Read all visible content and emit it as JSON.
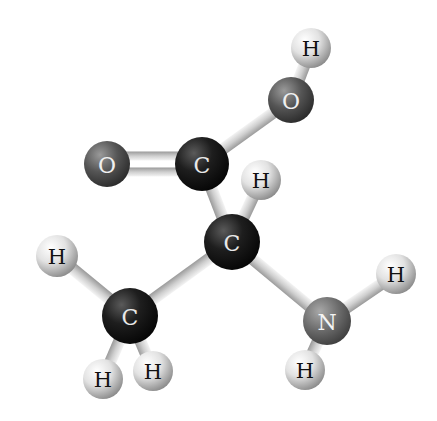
{
  "diagram": {
    "type": "ball-and-stick molecular model",
    "molecule_atoms": [
      {
        "id": "h_oh",
        "element": "H",
        "label": "H",
        "x": 311,
        "y": 48,
        "r": 20
      },
      {
        "id": "o_hydroxyl",
        "element": "O",
        "label": "O",
        "x": 291,
        "y": 100,
        "r": 23
      },
      {
        "id": "o_carbonyl",
        "element": "O",
        "label": "O",
        "x": 107,
        "y": 164,
        "r": 23
      },
      {
        "id": "c_carboxyl",
        "element": "C",
        "label": "C",
        "x": 202,
        "y": 164,
        "r": 27
      },
      {
        "id": "h_alpha",
        "element": "H",
        "label": "H",
        "x": 261,
        "y": 180,
        "r": 20
      },
      {
        "id": "c_alpha",
        "element": "C",
        "label": "C",
        "x": 232,
        "y": 242,
        "r": 28
      },
      {
        "id": "h_me_left",
        "element": "H",
        "label": "H",
        "x": 57,
        "y": 256,
        "r": 21
      },
      {
        "id": "c_methyl",
        "element": "C",
        "label": "C",
        "x": 130,
        "y": 316,
        "r": 28
      },
      {
        "id": "h_me_bl",
        "element": "H",
        "label": "H",
        "x": 103,
        "y": 379,
        "r": 20
      },
      {
        "id": "h_me_br",
        "element": "H",
        "label": "H",
        "x": 153,
        "y": 371,
        "r": 20
      },
      {
        "id": "n_amine",
        "element": "N",
        "label": "N",
        "x": 327,
        "y": 321,
        "r": 24
      },
      {
        "id": "h_n_right",
        "element": "H",
        "label": "H",
        "x": 396,
        "y": 274,
        "r": 20
      },
      {
        "id": "h_n_bottom",
        "element": "H",
        "label": "H",
        "x": 305,
        "y": 370,
        "r": 20
      }
    ],
    "bonds": [
      {
        "from": "o_hydroxyl",
        "to": "h_oh",
        "order": 1
      },
      {
        "from": "c_carboxyl",
        "to": "o_hydroxyl",
        "order": 1
      },
      {
        "from": "c_carboxyl",
        "to": "o_carbonyl",
        "order": 2
      },
      {
        "from": "c_carboxyl",
        "to": "c_alpha",
        "order": 1
      },
      {
        "from": "c_alpha",
        "to": "h_alpha",
        "order": 1
      },
      {
        "from": "c_alpha",
        "to": "c_methyl",
        "order": 1
      },
      {
        "from": "c_alpha",
        "to": "n_amine",
        "order": 1
      },
      {
        "from": "c_methyl",
        "to": "h_me_left",
        "order": 1
      },
      {
        "from": "c_methyl",
        "to": "h_me_bl",
        "order": 1
      },
      {
        "from": "c_methyl",
        "to": "h_me_br",
        "order": 1
      },
      {
        "from": "n_amine",
        "to": "h_n_right",
        "order": 1
      },
      {
        "from": "n_amine",
        "to": "h_n_bottom",
        "order": 1
      }
    ],
    "element_styles": {
      "C": {
        "fill_light": "#5a5a5a",
        "fill_dark": "#0c0c0c",
        "text": "#e8e8e8"
      },
      "O": {
        "fill_light": "#8a8a8a",
        "fill_dark": "#303030",
        "text": "#f0f0f0"
      },
      "N": {
        "fill_light": "#9a9a9a",
        "fill_dark": "#474747",
        "text": "#f4f4f4"
      },
      "H": {
        "fill_light": "#ffffff",
        "fill_dark": "#8c8c8c",
        "text": "#111111"
      }
    },
    "bond_color": "#d8d8d8",
    "background": "#ffffff"
  }
}
